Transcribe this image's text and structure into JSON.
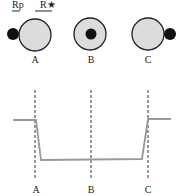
{
  "labels": {
    "rp": "Rp",
    "rstar": "R★",
    "positions": [
      "A",
      "B",
      "C"
    ],
    "axis_positions": [
      "A",
      "B",
      "C"
    ]
  },
  "colors": {
    "star_fill": "#dcdcdc",
    "star_stroke": "#222222",
    "planet": "#111111",
    "curve": "#999999",
    "dashed": "#333333"
  },
  "diagram": {
    "type": "transit light curve",
    "stages": [
      {
        "label": "A",
        "description": "planet at ingress, left limb of star"
      },
      {
        "label": "B",
        "description": "planet fully transiting star center"
      },
      {
        "label": "C",
        "description": "planet at egress, right limb of star"
      }
    ]
  }
}
